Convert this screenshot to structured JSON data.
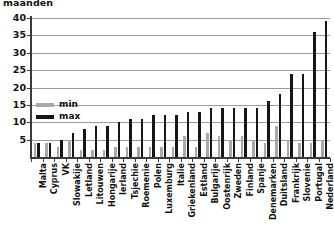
{
  "chart_data": {
    "type": "bar",
    "title": "maanden",
    "xlabel": "",
    "ylabel": "maanden",
    "ylim": [
      0,
      40
    ],
    "yticks": [
      0,
      5,
      10,
      15,
      20,
      25,
      30,
      35,
      40
    ],
    "ytick_labels": [
      "0",
      "5",
      "10",
      "15",
      "20",
      "25",
      "30",
      "35",
      "40"
    ],
    "grid": true,
    "legend_position": "inside-upper-left",
    "categories": [
      "Malta",
      "Cyprus",
      "VK",
      "Slowakije",
      "Letland",
      "Litouwen",
      "Hongarije",
      "Ierland",
      "Tsjechie",
      "Roemenie",
      "Polen",
      "Luxemburg",
      "Italie",
      "Griekenland",
      "Estland",
      "Bulgarije",
      "Oostenrijk",
      "Zweden",
      "Finland",
      "Spanje",
      "Denemarken",
      "Duitsland",
      "Frankrijk",
      "Slovenie",
      "Portugal",
      "Nederland"
    ],
    "series": [
      {
        "name": "min",
        "color": "#a9a9a9",
        "values": [
          4,
          4,
          3,
          5,
          2,
          2,
          2,
          3,
          3,
          3,
          3,
          3,
          3,
          6,
          3,
          7,
          6,
          5,
          6,
          5,
          4,
          9,
          5,
          4,
          4,
          5
        ]
      },
      {
        "name": "max",
        "color": "#161616",
        "values": [
          4,
          4,
          5,
          7,
          8,
          9,
          9,
          10,
          11,
          11,
          12,
          12,
          12,
          13,
          13,
          14,
          14,
          14,
          14,
          14,
          16,
          18,
          24,
          24,
          36,
          39
        ]
      }
    ]
  },
  "legend": {
    "entries": [
      {
        "label": "min",
        "color": "#a9a9a9"
      },
      {
        "label": "max",
        "color": "#161616"
      }
    ]
  },
  "colors": {
    "min": "#a9a9a9",
    "max": "#161616",
    "axis": "#3b3b3b",
    "grid": "#9a9a9a",
    "background": "#ffffff",
    "text": "#111111"
  }
}
